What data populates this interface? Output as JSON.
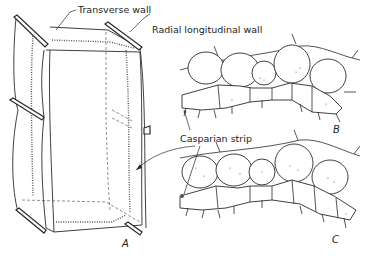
{
  "figure": {
    "labels": {
      "transverse_wall": "Transverse wall",
      "radial_longitudinal_wall": "Radial longitudinal wall",
      "casparian_strip_a": "Casparian strip",
      "casparian_strip_bc": "Casparian strip"
    },
    "panels": {
      "a": "A",
      "b": "B",
      "c": "C"
    }
  }
}
